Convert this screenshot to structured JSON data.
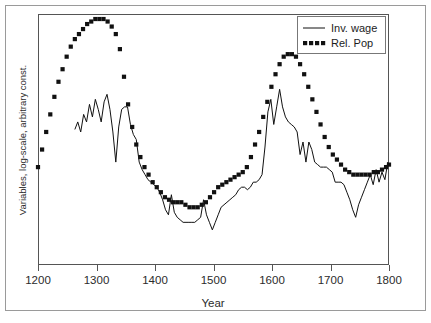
{
  "chart_data": {
    "type": "line",
    "title": "",
    "xlabel": "Year",
    "ylabel": "Variables, log-scale, arbitrary const.",
    "xlim": [
      1200,
      1800
    ],
    "ylim": [
      0,
      100
    ],
    "xticks": [
      1200,
      1300,
      1400,
      1500,
      1600,
      1700,
      1800
    ],
    "xtick_labels": [
      "1200",
      "1300",
      "1400",
      "1500",
      "1600",
      "1700",
      "1800"
    ],
    "yticks": [],
    "ytick_labels": [],
    "grid": false,
    "legend_position": "top-right",
    "series": [
      {
        "name": "Inv. wage",
        "style": "solid",
        "color": "#111111",
        "x": [
          1263,
          1268,
          1273,
          1278,
          1283,
          1288,
          1293,
          1298,
          1303,
          1308,
          1313,
          1318,
          1323,
          1328,
          1333,
          1338,
          1343,
          1348,
          1353,
          1358,
          1363,
          1368,
          1373,
          1378,
          1383,
          1388,
          1393,
          1398,
          1403,
          1408,
          1413,
          1418,
          1423,
          1428,
          1433,
          1438,
          1443,
          1448,
          1453,
          1458,
          1463,
          1468,
          1473,
          1478,
          1483,
          1488,
          1493,
          1498,
          1503,
          1508,
          1513,
          1518,
          1523,
          1528,
          1533,
          1538,
          1543,
          1548,
          1553,
          1558,
          1563,
          1568,
          1573,
          1578,
          1583,
          1588,
          1593,
          1598,
          1603,
          1608,
          1613,
          1618,
          1623,
          1628,
          1633,
          1638,
          1643,
          1648,
          1653,
          1658,
          1663,
          1668,
          1673,
          1678,
          1683,
          1688,
          1693,
          1698,
          1703,
          1708,
          1713,
          1718,
          1723,
          1728,
          1733,
          1738,
          1743,
          1748,
          1753,
          1758,
          1763,
          1768,
          1773,
          1778,
          1783,
          1788,
          1793,
          1798
        ],
        "y": [
          54,
          57,
          53,
          60,
          57,
          64,
          59,
          66,
          62,
          57,
          65,
          68,
          62,
          53,
          41,
          55,
          62,
          63,
          63,
          56,
          52,
          50,
          41,
          38,
          36,
          34,
          33,
          32,
          31,
          29,
          26,
          22,
          20,
          28,
          21,
          19,
          18,
          17,
          17,
          17,
          17,
          17,
          18,
          19,
          26,
          20,
          17,
          14,
          17,
          20,
          23,
          24,
          25,
          26,
          27,
          28,
          30,
          31,
          31,
          30,
          31,
          33,
          33,
          34,
          36,
          47,
          61,
          66,
          56,
          63,
          70,
          63,
          59,
          57,
          56,
          55,
          53,
          44,
          49,
          41,
          49,
          46,
          41,
          40,
          39,
          39,
          39,
          38,
          37,
          33,
          33,
          33,
          32,
          29,
          26,
          22,
          19,
          24,
          27,
          30,
          33,
          36,
          32,
          38,
          33,
          37,
          34,
          41
        ]
      },
      {
        "name": "Rel. Pop",
        "style": "dotted",
        "color": "#111111",
        "x": [
          1200,
          1207,
          1214,
          1221,
          1228,
          1235,
          1242,
          1249,
          1256,
          1263,
          1270,
          1277,
          1284,
          1291,
          1298,
          1305,
          1312,
          1319,
          1326,
          1333,
          1340,
          1347,
          1354,
          1361,
          1368,
          1375,
          1382,
          1389,
          1396,
          1403,
          1410,
          1417,
          1424,
          1431,
          1438,
          1445,
          1452,
          1459,
          1466,
          1473,
          1480,
          1487,
          1494,
          1501,
          1508,
          1515,
          1522,
          1529,
          1536,
          1543,
          1550,
          1557,
          1564,
          1571,
          1578,
          1585,
          1592,
          1599,
          1606,
          1613,
          1620,
          1627,
          1634,
          1641,
          1648,
          1655,
          1662,
          1669,
          1676,
          1683,
          1690,
          1697,
          1704,
          1711,
          1718,
          1725,
          1732,
          1739,
          1746,
          1753,
          1760,
          1767,
          1774,
          1781,
          1788,
          1795,
          1800
        ],
        "y": [
          39,
          46,
          53,
          60,
          67,
          73,
          78,
          83,
          87,
          90,
          92,
          94,
          96,
          97,
          98,
          98,
          98,
          97,
          95,
          92,
          86,
          75,
          64,
          55,
          48,
          43,
          39,
          36,
          33,
          31,
          29,
          27,
          26,
          25,
          25,
          25,
          24,
          23,
          23,
          23,
          24,
          25,
          27,
          29,
          31,
          32,
          33,
          34,
          35,
          36,
          37,
          39,
          43,
          48,
          53,
          59,
          65,
          71,
          76,
          80,
          83,
          84,
          84,
          83,
          80,
          76,
          71,
          66,
          61,
          56,
          51,
          47,
          44,
          42,
          40,
          38,
          37,
          36,
          36,
          36,
          36,
          36,
          37,
          37,
          38,
          39,
          40
        ]
      }
    ]
  },
  "legend": {
    "entries": [
      {
        "label": "Inv. wage",
        "style": "solid"
      },
      {
        "label": "Rel. Pop",
        "style": "dotted"
      }
    ]
  },
  "axes": {
    "x_title": "Year",
    "y_title": "Variables, log-scale, arbitrary const."
  }
}
